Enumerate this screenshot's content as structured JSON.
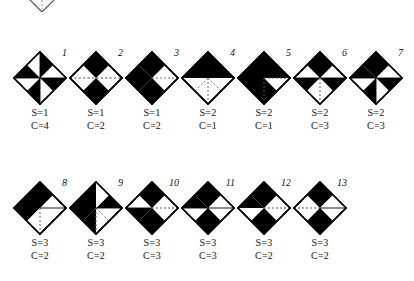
{
  "figure": {
    "type": "diagram",
    "background_color": "#ffffff",
    "fill_color": "#000000",
    "outline_color": "#000000",
    "dotted_line_color": "#555555",
    "partial_shape": {
      "name": "cropped-diamond-top",
      "visible": true
    },
    "rows": [
      {
        "row_id": "row-1",
        "tiles": [
          {
            "index": "1",
            "s_label": "S=1",
            "c_label": "C=4",
            "s_value": 1,
            "c_value": 4,
            "octants": [
              0,
              1,
              0,
              1,
              0,
              1,
              0,
              1
            ],
            "dotted": [
              "horizontal"
            ]
          },
          {
            "index": "2",
            "s_label": "S=1",
            "c_label": "C=2",
            "s_value": 1,
            "c_value": 2,
            "octants": [
              1,
              1,
              0,
              0,
              1,
              1,
              0,
              0
            ],
            "dotted": [
              "horizontal"
            ]
          },
          {
            "index": "3",
            "s_label": "S=1",
            "c_label": "C=2",
            "s_value": 1,
            "c_value": 2,
            "octants": [
              1,
              0,
              0,
              1,
              1,
              1,
              1,
              1
            ],
            "dotted": [
              "diag-ne",
              "diag-sw"
            ]
          },
          {
            "index": "4",
            "s_label": "S=2",
            "c_label": "C=1",
            "s_value": 2,
            "c_value": 1,
            "octants": [
              1,
              1,
              1,
              1,
              0,
              0,
              0,
              0
            ],
            "dotted": [
              "vertical-lower",
              "diag-lower"
            ]
          },
          {
            "index": "5",
            "s_label": "S=2",
            "c_label": "C=1",
            "s_value": 2,
            "c_value": 1,
            "octants": [
              1,
              1,
              1,
              0,
              0,
              1,
              1,
              1
            ],
            "dotted": [
              "horizontal-right",
              "vertical-lower"
            ]
          },
          {
            "index": "6",
            "s_label": "S=2",
            "c_label": "C=3",
            "s_value": 2,
            "c_value": 3,
            "octants": [
              1,
              1,
              0,
              0,
              0,
              1,
              1,
              0
            ],
            "dotted": [
              "vertical-lower"
            ]
          },
          {
            "index": "7",
            "s_label": "S=2",
            "c_label": "C=3",
            "s_value": 2,
            "c_value": 3,
            "octants": [
              1,
              0,
              0,
              1,
              1,
              0,
              0,
              1
            ],
            "dotted": [
              "diag-ne"
            ]
          }
        ]
      },
      {
        "row_id": "row-2",
        "tiles": [
          {
            "index": "8",
            "s_label": "S=3",
            "c_label": "C=2",
            "s_value": 3,
            "c_value": 2,
            "octants": [
              1,
              1,
              0,
              0,
              0,
              0,
              1,
              1
            ],
            "dotted": [
              "vertical-lower"
            ]
          },
          {
            "index": "9",
            "s_label": "S=3",
            "c_label": "C=2",
            "s_value": 3,
            "c_value": 2,
            "octants": [
              1,
              0,
              1,
              1,
              0,
              0,
              1,
              1
            ],
            "dotted": [
              "vertical-lower",
              "diag-lower"
            ]
          },
          {
            "index": "10",
            "s_label": "S=3",
            "c_label": "C=3",
            "s_value": 3,
            "c_value": 3,
            "octants": [
              1,
              1,
              0,
              0,
              1,
              0,
              0,
              1
            ],
            "dotted": [
              "horizontal-right"
            ]
          },
          {
            "index": "11",
            "s_label": "S=3",
            "c_label": "C=3",
            "s_value": 3,
            "c_value": 3,
            "octants": [
              1,
              0,
              0,
              1,
              1,
              0,
              1,
              1
            ],
            "dotted": [
              "diag-ne"
            ]
          },
          {
            "index": "12",
            "s_label": "S=3",
            "c_label": "C=2",
            "s_value": 3,
            "c_value": 2,
            "octants": [
              1,
              1,
              0,
              0,
              1,
              1,
              0,
              1
            ],
            "dotted": [
              "horizontal-right"
            ]
          },
          {
            "index": "13",
            "s_label": "S=3",
            "c_label": "C=2",
            "s_value": 3,
            "c_value": 2,
            "octants": [
              1,
              1,
              0,
              1,
              1,
              1,
              0,
              0
            ],
            "dotted": [
              "horizontal-left"
            ]
          }
        ]
      }
    ]
  }
}
